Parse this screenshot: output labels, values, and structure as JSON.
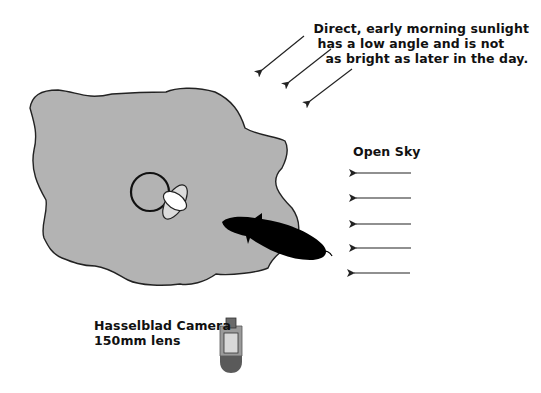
{
  "diagram": {
    "sunlight_label": {
      "lines": [
        "Direct, early morning sunlight",
        "has a low angle and is not",
        "as bright as later in the day."
      ]
    },
    "sky_label": "Open Sky",
    "camera_label": {
      "lines": [
        "Hasselblad Camera",
        "150mm lens"
      ]
    },
    "elements": {
      "ground_area": "gray irregular patch",
      "subject": "circle with light reflector petals",
      "shadow": "black elongated shadow",
      "sunlight_arrows": 3,
      "sky_arrows": 5,
      "camera": "camera top-view icon"
    },
    "colors": {
      "background": "#ffffff",
      "ground": "#b3b3b3",
      "outline": "#222222",
      "shadow": "#000000",
      "reflector_light": "#ffffff",
      "reflector_back": "#dcdcdc",
      "camera_body": "#9a9a9a",
      "camera_top": "#6a6a6a",
      "camera_screen": "#d8d8d8",
      "camera_bottom": "#5a5a5a"
    }
  }
}
